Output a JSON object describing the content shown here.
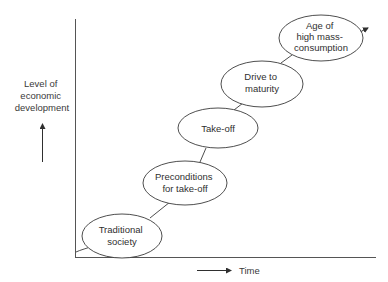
{
  "diagram": {
    "y_axis": {
      "label_lines": [
        "Level of",
        "economic",
        "development"
      ]
    },
    "x_axis": {
      "label": "Time"
    },
    "stages": [
      {
        "lines": [
          "Traditional",
          "society"
        ]
      },
      {
        "lines": [
          "Preconditions",
          "for take-off"
        ]
      },
      {
        "lines": [
          "Take-off"
        ]
      },
      {
        "lines": [
          "Drive to",
          "maturity"
        ]
      },
      {
        "lines": [
          "Age of",
          "high mass-",
          "consumption"
        ]
      }
    ],
    "colors": {
      "stroke": "#3a3a3a",
      "axis": "#5a5a5a",
      "background": "#ffffff"
    }
  }
}
